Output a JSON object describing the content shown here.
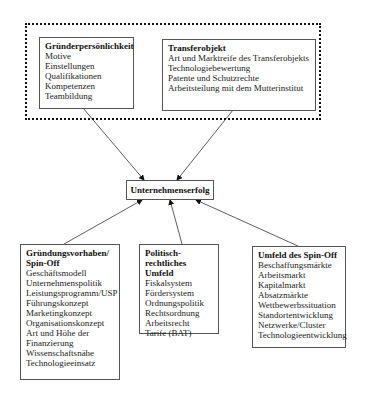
{
  "diagram": {
    "group": {
      "style": "dotted",
      "boxes": [
        "gruenderpersoenlichkeit",
        "transferobjekt"
      ]
    },
    "gruenderpersoenlichkeit": {
      "title": "Gründerpersönlichkeit",
      "items": [
        "Motive",
        "Einstellungen",
        "Qualifikationen",
        "Kompetenzen",
        "Teambildung"
      ]
    },
    "transferobjekt": {
      "title": "Transferobjekt",
      "items": [
        "Art und Marktreife des Transferobjekts",
        "Technologiebewertung",
        "Patente und Schutzrechte",
        "Arbeitsteilung mit dem Mutterinstitut"
      ]
    },
    "unternehmenserfolg": {
      "title": "Unternehmenserfolg"
    },
    "gruendungsvorhaben": {
      "title_line1": "Gründungsvorhaben/",
      "title_line2": "Spin-Off",
      "items": [
        "Geschäftsmodell",
        "Unternehmenspolitik",
        "Leistungsprogramm/USP",
        "Führungskonzept",
        "Marketingkonzept",
        "Organisationskonzept",
        "Art und Höhe der",
        "Finanzierung",
        "Wissenschaftsnähe",
        "Technologieeinsatz"
      ]
    },
    "politisch_rechtlich": {
      "title_line1": "Politisch-rechtliches",
      "title_line2": "Umfeld",
      "items": [
        "Fiskalsystem",
        "Fördersystem",
        "Ordnungspolitik",
        "Rechtsordnung",
        "Arbeitsrecht",
        "Tarife (BAT)"
      ]
    },
    "umfeld_spinoff": {
      "title": "Umfeld des Spin-Off",
      "items": [
        "Beschaffungsmärkte",
        "Arbeitsmarkt",
        "Kapitalmarkt",
        "Absatzmärkte",
        "Wettbewerbssituation",
        "Standortentwicklung",
        "Netzwerke/Cluster",
        "Technologieentwicklung"
      ]
    },
    "arrows": [
      {
        "from": "gruenderpersoenlichkeit",
        "to": "unternehmenserfolg"
      },
      {
        "from": "transferobjekt",
        "to": "unternehmenserfolg"
      },
      {
        "from": "gruendungsvorhaben",
        "to": "unternehmenserfolg"
      },
      {
        "from": "politisch_rechtlich",
        "to": "unternehmenserfolg"
      },
      {
        "from": "umfeld_spinoff",
        "to": "unternehmenserfolg"
      }
    ],
    "colors": {
      "line": "#333333",
      "border": "#555555",
      "text": "#1a1a1a",
      "background": "#ffffff"
    }
  }
}
